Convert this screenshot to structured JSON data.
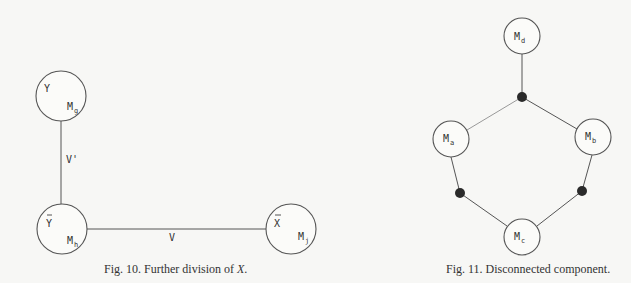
{
  "fig10": {
    "caption_prefix": "Fig. 10.  Further division of ",
    "caption_var": "X",
    "caption_suffix": ".",
    "nodes": {
      "y": {
        "set": "Y",
        "machine": "M",
        "sub": "g"
      },
      "ybar": {
        "set": "Y",
        "machine": "M",
        "sub": "h"
      },
      "xbar": {
        "set": "X",
        "machine": "M",
        "sub": "j"
      }
    },
    "edges": {
      "vprime": "V'",
      "v": "V"
    }
  },
  "fig11": {
    "caption": "Fig. 11.  Disconnected component.",
    "nodes": {
      "d": {
        "machine": "M",
        "sub": "d"
      },
      "a": {
        "machine": "M",
        "sub": "a"
      },
      "b": {
        "machine": "M",
        "sub": "b"
      },
      "c": {
        "machine": "M",
        "sub": "c"
      }
    },
    "junctions": 3
  }
}
